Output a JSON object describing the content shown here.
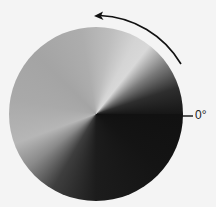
{
  "diagram": {
    "title": "",
    "type": "conic gradient angle diagram",
    "zero_label": "0°",
    "arrow_direction": "counterclockwise",
    "colors": {
      "background": "#f4f4f4",
      "arrow": "#111111",
      "label": "#222222"
    }
  }
}
